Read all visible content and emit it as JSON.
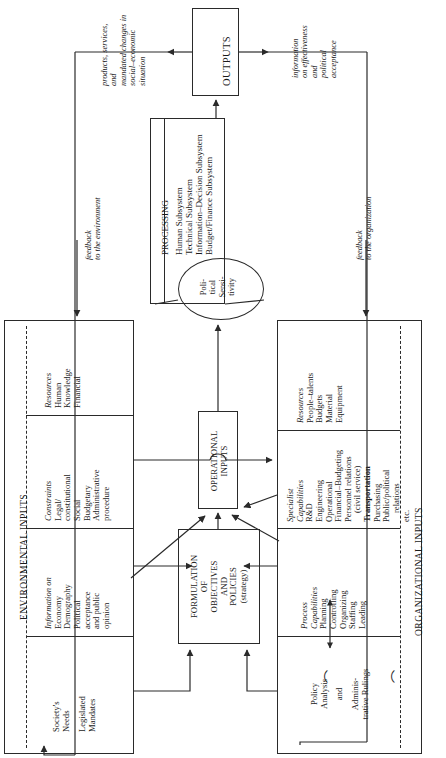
{
  "figure": {
    "orientation": "rotated-90-ccw"
  },
  "outputs": {
    "box_label": "OUTPUTS",
    "left_caption": "products, services,\nand\nmandated changes in\nsocial–economic\nsituation",
    "left_caption_lines": [
      "products, services,",
      "and",
      "mandated changes in",
      "social–economic",
      "situation"
    ],
    "right_caption_lines": [
      "information",
      "on effectiveness",
      "and",
      "political",
      "acceptance"
    ]
  },
  "feedback": {
    "environment_lines": [
      "feedback",
      "to the environment"
    ],
    "organization_lines": [
      "feedback",
      "to the organization"
    ]
  },
  "processing": {
    "header": "PROCESSING",
    "subsystems": [
      "Human Subsystem",
      "Technical Subsystem",
      "Information–Decision Subsystem",
      "Budget/Finance Subsystem"
    ],
    "political_sensitivity_lines": [
      "Poli-",
      "tical",
      "Sensi-",
      "tivity"
    ]
  },
  "environmental_inputs": {
    "spine_label": "ENVIRONMENTAL INPUTS",
    "cells": [
      {
        "heading": "Resources",
        "items": [
          "Human",
          "Knowledge",
          "Financial"
        ]
      },
      {
        "heading": "Constraints",
        "items": [
          "Legal/",
          "constitutional",
          "Social",
          "Budgetary",
          "Administrative",
          "procedure"
        ]
      },
      {
        "heading": "Information on",
        "items": [
          "Economy",
          "Demography",
          "Political",
          "acceptance",
          "and public",
          "opinion"
        ]
      },
      {
        "heading": "",
        "items": [
          "Society's",
          "Needs",
          "Legislated",
          "Mandates"
        ]
      }
    ]
  },
  "organizational_inputs": {
    "spine_label": "ORGANIZATIONAL INPUTS",
    "cells": [
      {
        "heading": "Resources",
        "items": [
          "People–talents",
          "Budgets",
          "Material",
          "Equipment"
        ]
      },
      {
        "heading": "Specialist\nCapabilities",
        "heading_lines": [
          "Specialist",
          "Capabilities"
        ],
        "items": [
          "R&D",
          "Engineering",
          "Operational",
          "Financial–Budgeting",
          "Personnel relations",
          "(civil service)",
          "Transportation",
          "Purchasing",
          "Public/political",
          "relations",
          "etc."
        ],
        "bold_items": [
          "Transportation"
        ]
      },
      {
        "heading": "Process\nCapabilities",
        "heading_lines": [
          "Process",
          "Capabilities"
        ],
        "items": [
          "Planning",
          "Controlling",
          "Organizing",
          "Staffing",
          "Leading"
        ]
      },
      {
        "heading": "",
        "items": [
          "Policy",
          "Analysis",
          "and",
          "Adminis-",
          "trative Rulings"
        ]
      }
    ]
  },
  "operational_inputs": {
    "label_lines": [
      "OPERATIONAL",
      "INPUTS"
    ]
  },
  "formulation": {
    "label_lines": [
      "FORMULATION",
      "OF",
      "OBJECTIVES",
      "AND",
      "POLICIES",
      "(strategy)"
    ]
  },
  "colors": {
    "ink": "#1a1a1a",
    "line": "#2a2a2a",
    "background": "#ffffff"
  }
}
